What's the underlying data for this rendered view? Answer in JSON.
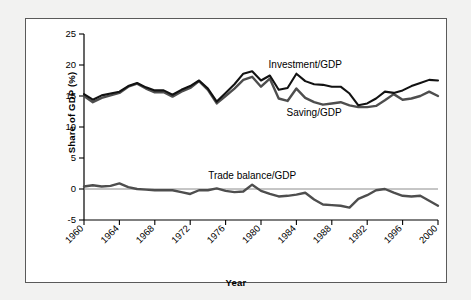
{
  "figure": {
    "background_color": "#f2f2f1",
    "panel_color": "#ffffff",
    "border_color": "#5a5a5a"
  },
  "axis": {
    "ylabel": "Share of GDP (%)",
    "xlabel": "Year",
    "y_ticks": [
      "25",
      "20",
      "15",
      "10",
      "5",
      "0",
      "-5"
    ],
    "x_ticks": [
      "1960",
      "1964",
      "1968",
      "1972",
      "1976",
      "1980",
      "1984",
      "1988",
      "1992",
      "1996",
      "2000"
    ]
  },
  "labels": {
    "investment": "Investment/GDP",
    "saving": "Saving/GDP",
    "trade": "Trade balance/GDP"
  },
  "colors": {
    "investment": "#121212",
    "saving": "#4e4e4e",
    "trade": "#4e4e4e",
    "zero_line": "#8c8c8c"
  },
  "chart_data": {
    "type": "line",
    "title": "",
    "xlabel": "Year",
    "ylabel": "Share of GDP (%)",
    "xlim": [
      1960,
      2000
    ],
    "ylim": [
      -5,
      25
    ],
    "y_ticks": [
      25,
      20,
      15,
      10,
      5,
      0,
      -5
    ],
    "x_ticks": [
      1960,
      1964,
      1968,
      1972,
      1976,
      1980,
      1984,
      1988,
      1992,
      1996,
      2000
    ],
    "grid": false,
    "legend": "inline-annotations",
    "x": [
      1960,
      1961,
      1962,
      1963,
      1964,
      1965,
      1966,
      1967,
      1968,
      1969,
      1970,
      1971,
      1972,
      1973,
      1974,
      1975,
      1976,
      1977,
      1978,
      1979,
      1980,
      1981,
      1982,
      1983,
      1984,
      1985,
      1986,
      1987,
      1988,
      1989,
      1990,
      1991,
      1992,
      1993,
      1994,
      1995,
      1996,
      1997,
      1998,
      1999,
      2000
    ],
    "series": [
      {
        "name": "Investment/GDP",
        "color": "#121212",
        "values": [
          15.3,
          14.4,
          15.1,
          15.4,
          15.7,
          16.6,
          17.1,
          16.4,
          15.9,
          15.9,
          15.2,
          16.0,
          16.6,
          17.5,
          16.2,
          14.1,
          15.5,
          16.9,
          18.6,
          19.0,
          17.5,
          18.3,
          16.0,
          16.3,
          18.6,
          17.4,
          16.9,
          16.8,
          16.5,
          16.5,
          15.4,
          13.5,
          13.8,
          14.6,
          15.7,
          15.5,
          15.9,
          16.6,
          17.1,
          17.6,
          17.5
        ]
      },
      {
        "name": "Saving/GDP",
        "color": "#4e4e4e",
        "values": [
          15.0,
          14.0,
          14.7,
          15.1,
          15.5,
          16.5,
          17.0,
          16.2,
          15.6,
          15.6,
          14.9,
          15.7,
          16.3,
          17.4,
          16.0,
          13.8,
          15.0,
          16.2,
          17.6,
          18.1,
          16.5,
          17.8,
          14.6,
          14.2,
          16.2,
          14.7,
          14.0,
          13.6,
          13.8,
          14.0,
          13.5,
          13.2,
          13.2,
          13.4,
          14.3,
          15.3,
          14.4,
          14.6,
          15.0,
          15.7,
          15.0
        ]
      },
      {
        "name": "Trade balance/GDP",
        "color": "#4e4e4e",
        "values": [
          0.4,
          0.6,
          0.4,
          0.5,
          0.9,
          0.3,
          0.0,
          -0.1,
          -0.2,
          -0.2,
          -0.2,
          -0.5,
          -0.8,
          -0.2,
          -0.2,
          0.1,
          -0.3,
          -0.5,
          -0.4,
          0.7,
          -0.3,
          -0.8,
          -1.2,
          -1.1,
          -0.9,
          -0.6,
          -1.7,
          -2.5,
          -2.6,
          -2.7,
          -3.0,
          -1.6,
          -1.0,
          -0.2,
          0.0,
          -0.6,
          -1.1,
          -1.2,
          -1.1,
          -1.9,
          -2.7
        ]
      }
    ],
    "annotations": [
      {
        "text": "Investment/GDP",
        "x": 1985,
        "y": 19.5
      },
      {
        "text": "Saving/GDP",
        "x": 1986,
        "y": 11.8
      },
      {
        "text": "Trade balance/GDP",
        "x": 1979,
        "y": 1.6
      }
    ]
  }
}
